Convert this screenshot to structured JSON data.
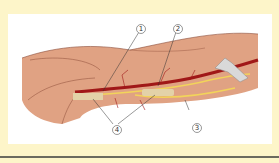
{
  "figure": {
    "type": "anatomical illustration",
    "colors": {
      "background": "#fdf5c9",
      "panel": "#ffffff",
      "muscle": "#e0a283",
      "artery": "#a01818",
      "nerve": "#f2d45a",
      "retractor": "#d9d9d9"
    },
    "callouts": [
      {
        "id": "1",
        "label": "1"
      },
      {
        "id": "2",
        "label": "2"
      },
      {
        "id": "3",
        "label": "3"
      },
      {
        "id": "4",
        "label": "4"
      }
    ]
  }
}
